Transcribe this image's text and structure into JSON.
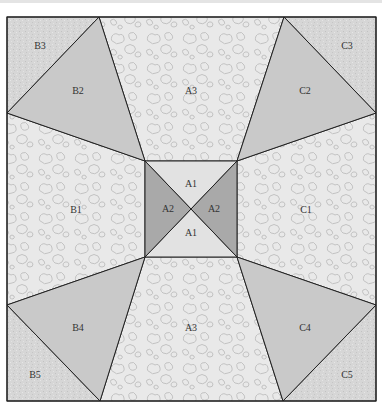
{
  "diagram": {
    "colors": {
      "pattern_bg": "#e9e9e9",
      "pattern_stroke": "#bdbdbd",
      "speckle_bg": "#d6d6d6",
      "triangle_light": "#c9c9c9",
      "triangle_dark": "#a9a9a9",
      "center_light": "#e2e2e2",
      "outline": "#222222"
    },
    "pieces": [
      {
        "id": "B3",
        "label": "B3",
        "fill": "speckle",
        "points": "7,17 99,17 7,113",
        "label_pos": [
          40,
          46
        ]
      },
      {
        "id": "B2",
        "label": "B2",
        "fill": "triangle_light",
        "points": "99,17 7,113 145,161",
        "label_pos": [
          78,
          92
        ]
      },
      {
        "id": "A3-top",
        "label": "A3",
        "fill": "pattern",
        "points": "99,17 284,17 237,161 145,161",
        "label_pos": [
          191,
          92
        ]
      },
      {
        "id": "C2",
        "label": "C2",
        "fill": "triangle_light",
        "points": "284,17 376,113 237,161",
        "label_pos": [
          305,
          92
        ]
      },
      {
        "id": "C3",
        "label": "C3",
        "fill": "speckle",
        "points": "284,17 376,17 376,113",
        "label_pos": [
          347,
          46
        ]
      },
      {
        "id": "B1",
        "label": "B1",
        "fill": "pattern",
        "points": "7,113 145,161 145,257 7,305",
        "label_pos": [
          76,
          210
        ]
      },
      {
        "id": "C1",
        "label": "C1",
        "fill": "pattern",
        "points": "376,113 237,161 237,257 376,305",
        "label_pos": [
          306,
          210
        ]
      },
      {
        "id": "B4",
        "label": "B4",
        "fill": "triangle_light",
        "points": "7,305 145,257 100,401",
        "label_pos": [
          78,
          329
        ]
      },
      {
        "id": "A3-bottom",
        "label": "A3",
        "fill": "pattern",
        "points": "145,257 237,257 283,401 100,401",
        "label_pos": [
          191,
          329
        ]
      },
      {
        "id": "C4",
        "label": "C4",
        "fill": "triangle_light",
        "points": "376,305 237,257 283,401",
        "label_pos": [
          305,
          329
        ]
      },
      {
        "id": "B5",
        "label": "B5",
        "fill": "speckle",
        "points": "7,305 100,401 7,401",
        "label_pos": [
          35,
          376
        ]
      },
      {
        "id": "C5",
        "label": "C5",
        "fill": "speckle",
        "points": "376,305 376,401 283,401",
        "label_pos": [
          347,
          376
        ]
      },
      {
        "id": "A1-top",
        "label": "A1",
        "fill": "center_light",
        "points": "145,161 237,161 191,209",
        "label_pos": [
          191,
          185
        ]
      },
      {
        "id": "A2-left",
        "label": "A2",
        "fill": "triangle_dark",
        "points": "145,161 191,209 145,257",
        "label_pos": [
          169,
          209
        ]
      },
      {
        "id": "A2-right",
        "label": "A2",
        "fill": "triangle_dark",
        "points": "237,161 237,257 191,209",
        "label_pos": [
          214,
          209
        ]
      },
      {
        "id": "A1-bottom",
        "label": "A1",
        "fill": "center_light",
        "points": "145,257 237,257 191,209",
        "label_pos": [
          191,
          233
        ]
      }
    ],
    "labels": {
      "B3": "B3",
      "B2": "B2",
      "A3_top": "A3",
      "C2": "C2",
      "C3": "C3",
      "B1": "B1",
      "C1": "C1",
      "A1_top": "A1",
      "A2_left": "A2",
      "A2_right": "A2",
      "A1_bottom": "A1",
      "B4": "B4",
      "A3_bottom": "A3",
      "C4": "C4",
      "B5": "B5",
      "C5": "C5"
    }
  }
}
